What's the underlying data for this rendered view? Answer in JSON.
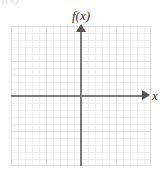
{
  "figure": {
    "kind": "blank-coordinate-grid",
    "clipped_header_fragment": "f(x)",
    "background_color": "#ffffff",
    "axis_color": "#7a7a7a",
    "arrow_color": "#555555",
    "grid_minor_color": "#ececec",
    "grid_major_color": "#dcdcdc",
    "label_color": "#2e2e2e"
  },
  "labels": {
    "y_axis": "f(x)",
    "x_axis": "x"
  },
  "chart_data": {
    "type": "scatter",
    "title": "",
    "subtitle": "",
    "xlabel": "x",
    "ylabel": "f(x)",
    "series": [
      {
        "name": "empty",
        "x": [],
        "y": []
      }
    ],
    "x": [],
    "categories": [],
    "values": [],
    "xlim": [
      -10,
      10
    ],
    "ylim": [
      -10,
      10
    ],
    "xticks": [],
    "yticks": [],
    "tick_labels_shown": false,
    "grid": true,
    "grid_minor_step": 1,
    "grid_major_step": 5,
    "minor_cells_x": 20,
    "minor_cells_y": 20,
    "legend": false,
    "legend_position": "none",
    "annotations": []
  }
}
